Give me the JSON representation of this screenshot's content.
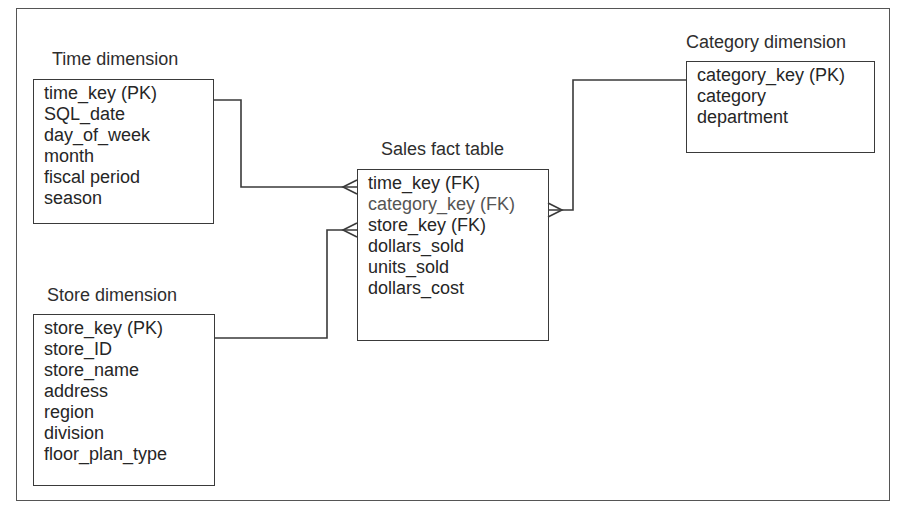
{
  "diagram": {
    "type": "star-schema",
    "colors": {
      "line": "#3a3a3a",
      "text": "#262626",
      "background": "#ffffff"
    }
  },
  "tables": {
    "time": {
      "title": "Time dimension",
      "fields": [
        "time_key (PK)",
        "SQL_date",
        "day_of_week",
        "month",
        "fiscal period",
        "season"
      ]
    },
    "store": {
      "title": "Store dimension",
      "fields": [
        "store_key (PK)",
        "store_ID",
        "store_name",
        "address",
        "region",
        "division",
        "floor_plan_type"
      ]
    },
    "sales": {
      "title": "Sales fact table",
      "fields": [
        "time_key (FK)",
        "category_key (FK)",
        "store_key (FK)",
        "dollars_sold",
        "units_sold",
        "dollars_cost"
      ]
    },
    "category": {
      "title": "Category dimension",
      "fields": [
        "category_key (PK)",
        "category",
        "department"
      ]
    }
  },
  "relationships": [
    {
      "from": "Time dimension.time_key (PK)",
      "to": "Sales fact table.time_key (FK)",
      "cardinality": "one-to-many"
    },
    {
      "from": "Store dimension.store_key (PK)",
      "to": "Sales fact table.store_key (FK)",
      "cardinality": "one-to-many"
    },
    {
      "from": "Category dimension.category_key (PK)",
      "to": "Sales fact table.category_key (FK)",
      "cardinality": "one-to-many"
    }
  ]
}
